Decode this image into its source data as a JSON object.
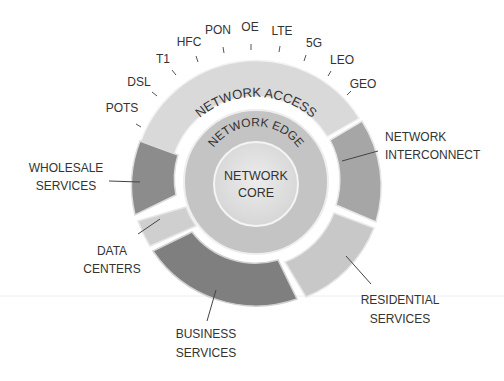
{
  "diagram": {
    "core": {
      "line1": "NETWORK",
      "line2": "CORE"
    },
    "edge": {
      "label": "NETWORK EDGE"
    },
    "access": {
      "label": "NETWORK ACCESS"
    },
    "access_technologies": [
      "POTS",
      "DSL",
      "T1",
      "HFC",
      "PON",
      "OE",
      "LTE",
      "5G",
      "LEO",
      "GEO"
    ],
    "segments": [
      {
        "id": "interconnect",
        "line1": "NETWORK",
        "line2": "INTERCONNECT"
      },
      {
        "id": "residential",
        "line1": "RESIDENTIAL",
        "line2": "SERVICES"
      },
      {
        "id": "business",
        "line1": "BUSINESS",
        "line2": "SERVICES"
      },
      {
        "id": "datacenters",
        "line1": "DATA",
        "line2": "CENTERS"
      },
      {
        "id": "wholesale",
        "line1": "WHOLESALE",
        "line2": "SERVICES"
      }
    ],
    "colors": {
      "access": "#d9d9d9",
      "edge": "#c4c4c4",
      "core": "#e2e2e2",
      "interconnect": "#a6a6a6",
      "residential": "#c8c8c8",
      "business": "#7f7f7f",
      "datacenters": "#cfcfcf",
      "wholesale": "#8c8c8c",
      "text": "#333333"
    }
  }
}
